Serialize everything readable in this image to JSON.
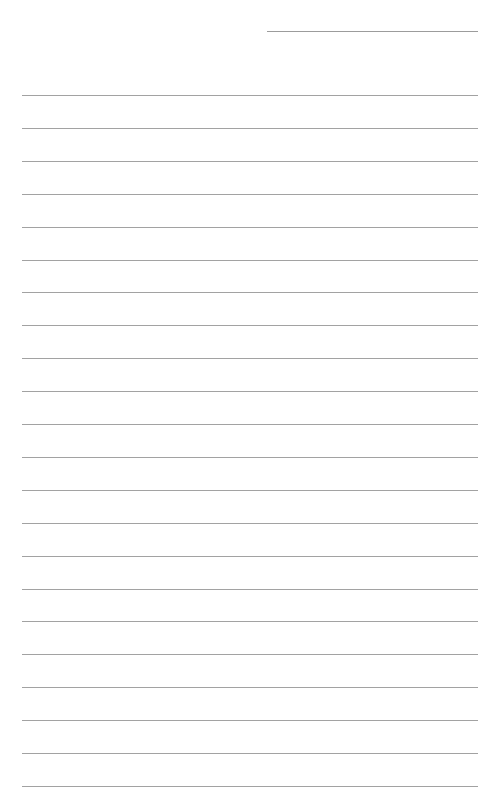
{
  "page": {
    "type": "lined-paper",
    "background_color": "#ffffff",
    "line_color": "#a2a2a2",
    "header_line": {
      "present": true,
      "position": "top-right"
    },
    "ruled_lines": {
      "count": 22,
      "first_top_px": 95,
      "spacing_px": 32.9
    }
  }
}
